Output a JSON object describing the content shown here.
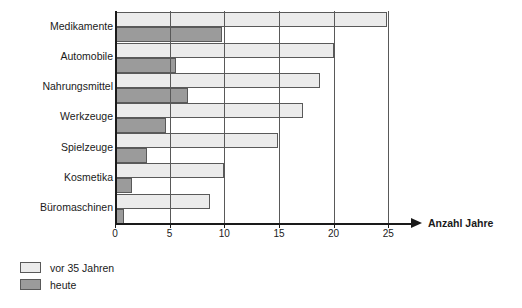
{
  "chart_data": {
    "type": "bar",
    "orientation": "horizontal",
    "title": "",
    "xlabel": "Anzahl Jahre",
    "ylabel": "",
    "xlim": [
      0,
      27.5
    ],
    "xticks": [
      0,
      5,
      10,
      15,
      20,
      25
    ],
    "xtick_labels": [
      "0",
      "5",
      "10",
      "15",
      "20",
      "25"
    ],
    "grid": true,
    "legend_position": "below-left",
    "categories": [
      "Medikamente",
      "Automobile",
      "Nahrungsmittel",
      "Werkzeuge",
      "Spielzeuge",
      "Kosmetika",
      "Büromaschinen"
    ],
    "series": [
      {
        "name": "vor 35 Jahren",
        "color": "#ebebeb",
        "values": [
          24.9,
          20.0,
          18.8,
          17.2,
          14.9,
          10.0,
          8.7
        ]
      },
      {
        "name": "heute",
        "color": "#9b9b9b",
        "values": [
          9.8,
          5.6,
          6.7,
          4.7,
          2.9,
          1.6,
          0.8
        ]
      }
    ]
  },
  "legend": {
    "items": [
      {
        "label": "vor 35 Jahren",
        "swatch": "light"
      },
      {
        "label": "heute",
        "swatch": "dark"
      }
    ]
  },
  "axis": {
    "arrow_label": "Anzahl Jahre"
  },
  "colors": {
    "series_light": "#ebebeb",
    "series_dark": "#9b9b9b",
    "grid": "#595959",
    "axis": "#1a1a1a",
    "background": "#ffffff"
  }
}
